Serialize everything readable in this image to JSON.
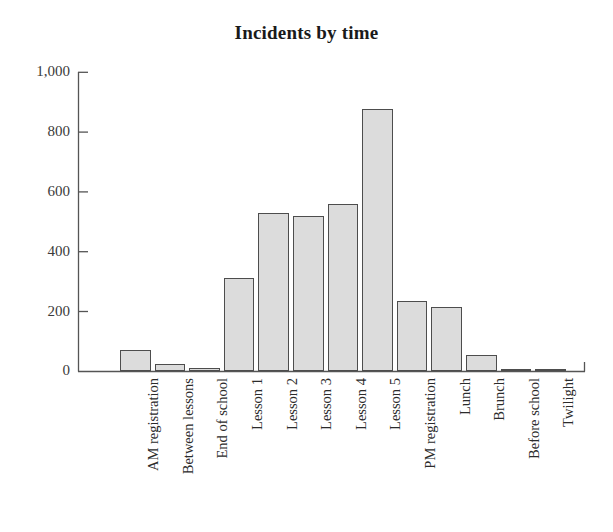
{
  "chart_data": {
    "type": "bar",
    "title": "Incidents by time",
    "xlabel": "",
    "ylabel": "",
    "ylim": [
      0,
      1000
    ],
    "yticks": [
      0,
      200,
      400,
      600,
      800,
      1000
    ],
    "ytick_labels": [
      "0",
      "200",
      "400",
      "600",
      "800",
      "1,000"
    ],
    "grid": false,
    "legend": false,
    "legend_position": "none",
    "categories": [
      "AM registration",
      "Between lessons",
      "End of school",
      "Lesson 1",
      "Lesson 2",
      "Lesson 3",
      "Lesson 4",
      "Lesson 5",
      "PM registration",
      "Lunch",
      "Brunch",
      "Before school",
      "Twilight"
    ],
    "values": [
      70,
      25,
      10,
      310,
      530,
      520,
      560,
      875,
      235,
      215,
      55,
      5,
      8
    ],
    "bar_fill_color": "#dcdcdc",
    "bar_edge_color": "#4d4d4d",
    "axis_color": "#555555",
    "text_color": "#2b2b2b"
  }
}
